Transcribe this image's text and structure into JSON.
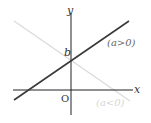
{
  "diagram": {
    "type": "coordinate-plane-lines",
    "axes": {
      "x_label": "x",
      "y_label": "y",
      "origin_label": "O"
    },
    "intercept_label": "b",
    "lines": [
      {
        "name": "positive-slope",
        "label": "(a>0)",
        "color": "#3a3a3a"
      },
      {
        "name": "negative-slope",
        "label": "(a<0)",
        "color": "#d9d9d9"
      }
    ],
    "colors": {
      "axis": "#222222",
      "text": "#333333",
      "faint_text": "#c8c8c8"
    }
  }
}
